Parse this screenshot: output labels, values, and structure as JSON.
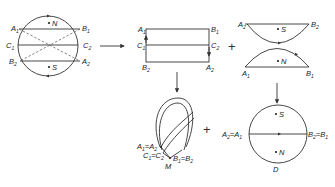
{
  "diagram": {
    "type": "topology-construction",
    "panels": {
      "disk": {
        "points": [
          "A1",
          "B1",
          "C1",
          "C2",
          "B2",
          "A2"
        ],
        "poles": [
          "N",
          "S"
        ]
      },
      "rectangle": {
        "corners": [
          "A1",
          "B1",
          "B2",
          "A2"
        ],
        "midpoints": [
          "C1",
          "C2"
        ]
      },
      "caps": {
        "top": {
          "left": "A2",
          "right": "B2",
          "pole": "S"
        },
        "bottom": {
          "left": "A1",
          "right": "B1",
          "pole": "N"
        }
      },
      "mobius": {
        "labels": [
          "A1=A2",
          "C1=C2",
          "B1=B2"
        ],
        "name": "M"
      },
      "projective_disk": {
        "left": "A2=A1",
        "right": "B2=B1",
        "poles": [
          "S",
          "N"
        ],
        "name": "D"
      }
    },
    "operators": [
      "+",
      "+"
    ]
  }
}
